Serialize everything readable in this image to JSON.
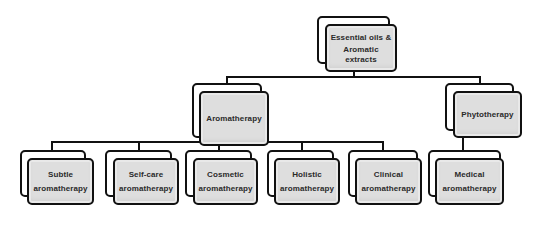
{
  "diagram": {
    "type": "hierarchy",
    "root": {
      "label_lines": [
        "Essential oils &",
        "Aromatic",
        "extracts"
      ]
    },
    "level1": [
      {
        "id": "aromatherapy",
        "label_lines": [
          "Aromatherapy"
        ]
      },
      {
        "id": "phytotherapy",
        "label_lines": [
          "Phytotherapy"
        ]
      }
    ],
    "level2": [
      {
        "id": "subtle",
        "parent": "aromatherapy",
        "label_lines": [
          "Subtle",
          "aromatherapy"
        ]
      },
      {
        "id": "self-care",
        "parent": "aromatherapy",
        "label_lines": [
          "Self-care",
          "aromatherapy"
        ]
      },
      {
        "id": "cosmetic",
        "parent": "aromatherapy",
        "label_lines": [
          "Cosmetic",
          "aromatherapy"
        ]
      },
      {
        "id": "holistic",
        "parent": "aromatherapy",
        "label_lines": [
          "Holistic",
          "aromatherapy"
        ]
      },
      {
        "id": "clinical",
        "parent": "aromatherapy",
        "label_lines": [
          "Clinical",
          "aromatherapy"
        ]
      },
      {
        "id": "medical",
        "parent": "phytotherapy",
        "label_lines": [
          "Medical",
          "aromatherapy"
        ]
      }
    ],
    "colors": {
      "box_fill": "#dedede",
      "border": "#111111",
      "text": "#2a2a2a",
      "background": "#ffffff"
    }
  }
}
